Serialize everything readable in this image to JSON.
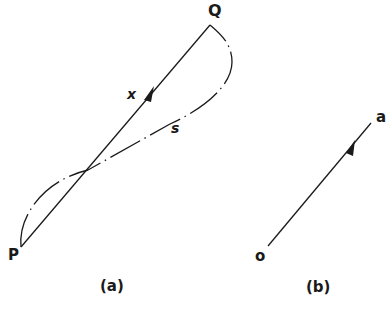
{
  "figure_a": {
    "point_start": "P",
    "point_end": "Q",
    "vector_label": "x",
    "path_label": "s",
    "caption": "(a)"
  },
  "figure_b": {
    "point_start": "o",
    "point_end": "a",
    "caption": "(b)"
  },
  "colors": {
    "line": "#1a1a1a",
    "background": "#ffffff"
  }
}
